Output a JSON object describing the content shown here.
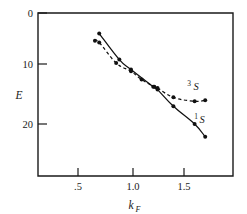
{
  "chart_data": {
    "type": "line",
    "title": "",
    "subtitle": "",
    "xlabel": "k_F",
    "xlabel_base": "k",
    "xlabel_sub": "F",
    "ylabel": "E",
    "xlim": [
      0.28,
      1.78
    ],
    "ylim": [
      0,
      29.5
    ],
    "y_inverted": true,
    "grid": false,
    "legend_position": "inline-annotation",
    "xticks": [
      0.5,
      1.0,
      1.5
    ],
    "xtick_labels": [
      ".5",
      "1.0",
      "1.5"
    ],
    "yticks": [
      0,
      10,
      20
    ],
    "ytick_labels": [
      "0",
      "10",
      "20"
    ],
    "series": [
      {
        "name": "1S",
        "label_sup": "1",
        "label_main": "S",
        "style": "solid",
        "marker": "filled-circle",
        "x": [
          0.7,
          0.89,
          1.0,
          1.21,
          1.25,
          1.4,
          1.6,
          1.7
        ],
        "y": [
          3.7,
          8.4,
          10.2,
          13.3,
          13.8,
          16.8,
          20.0,
          22.3
        ]
      },
      {
        "name": "3S",
        "label_sup": "3",
        "label_main": "S",
        "style": "dashed",
        "marker": "filled-circle",
        "x": [
          0.66,
          0.7,
          0.86,
          1.0,
          1.1,
          1.22,
          1.25,
          1.4,
          1.6,
          1.7
        ],
        "y": [
          5.0,
          5.3,
          9.0,
          10.5,
          12.0,
          13.3,
          13.5,
          15.2,
          15.9,
          15.7
        ]
      }
    ],
    "annotations": [
      {
        "name": "series-label-3S",
        "text": "3S",
        "x": 1.48,
        "y": 13.6
      },
      {
        "name": "series-label-1S",
        "text": "1S",
        "x": 1.62,
        "y": 19.1
      }
    ]
  }
}
